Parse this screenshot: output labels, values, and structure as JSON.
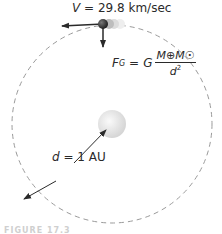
{
  "figure": {
    "velocity_label": {
      "symbol": "V",
      "equals": "=",
      "value": "29.8 km/sec"
    },
    "force_label": {
      "lhs_symbol": "F",
      "lhs_subscript": "G",
      "equals": "=",
      "constant": "G",
      "numerator": "M⊕M☉",
      "denominator_symbol": "d",
      "denominator_power": "2"
    },
    "distance_label": {
      "symbol": "d",
      "equals": "=",
      "value": "1 AU"
    },
    "caption": "FIGURE 17.3",
    "elements": {
      "orbit": "dashed-circle",
      "sun": "sun-sphere",
      "earth": "earth-sphere",
      "velocity_vector": "arrow-left",
      "gravity_vector": "arrow-down",
      "distance_vector": "double-arrow"
    },
    "colors": {
      "ink": "#2a2a2a",
      "orbit": "#9a9a9a",
      "sun": "#e6e6e6",
      "earth": "#3a3a3a"
    }
  }
}
